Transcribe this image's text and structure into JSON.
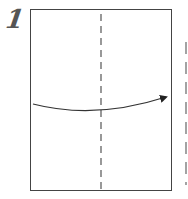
{
  "step": {
    "number": "1"
  },
  "diagram": {
    "paper": {
      "x": 30,
      "y": 9,
      "width": 141,
      "height": 182,
      "stroke": "#444444"
    },
    "fold_line": {
      "type": "valley",
      "style": "dashed",
      "x": 101
    },
    "arrow": {
      "direction": "left-to-right",
      "from": [
        33,
        104
      ],
      "to": [
        168,
        97
      ]
    },
    "next_panel_edge": {
      "style": "dashed",
      "x": 186,
      "partial": true
    }
  }
}
